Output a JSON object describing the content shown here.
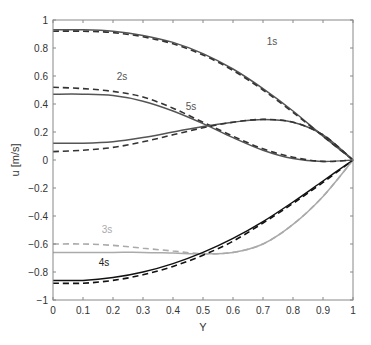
{
  "chart_data": {
    "type": "line",
    "title": "",
    "xlabel": "Y",
    "ylabel": "u [m/s]",
    "xlim": [
      0,
      1
    ],
    "ylim": [
      -1,
      1
    ],
    "grid": false,
    "x_ticks": [
      "0",
      "0.1",
      "0.2",
      "0.3",
      "0.4",
      "0.5",
      "0.6",
      "0.7",
      "0.8",
      "0.9",
      "1"
    ],
    "y_ticks": [
      "1",
      "0.8",
      "0.6",
      "0.4",
      "0.2",
      "0",
      "−0.2",
      "−0.4",
      "−0.6",
      "−0.8",
      "−1"
    ],
    "x": [
      0,
      0.1,
      0.2,
      0.3,
      0.4,
      0.5,
      0.6,
      0.7,
      0.8,
      0.9,
      1.0
    ],
    "annotations": [
      {
        "text": "1s",
        "x": 0.73,
        "y": 0.82,
        "color": "#555555"
      },
      {
        "text": "2s",
        "x": 0.23,
        "y": 0.57,
        "color": "#555555"
      },
      {
        "text": "5s",
        "x": 0.46,
        "y": 0.36,
        "color": "#555555"
      },
      {
        "text": "3s",
        "x": 0.18,
        "y": -0.52,
        "color": "#aaaaaa"
      },
      {
        "text": "4s",
        "x": 0.17,
        "y": -0.76,
        "color": "#222222"
      }
    ],
    "series": [
      {
        "name": "1s solid",
        "style": "solid",
        "color": "#555555",
        "values": [
          0.93,
          0.93,
          0.92,
          0.89,
          0.84,
          0.76,
          0.65,
          0.51,
          0.35,
          0.17,
          0.0
        ]
      },
      {
        "name": "1s dashed",
        "style": "dashed",
        "color": "#333333",
        "values": [
          0.92,
          0.92,
          0.91,
          0.88,
          0.83,
          0.75,
          0.64,
          0.5,
          0.34,
          0.17,
          0.0
        ]
      },
      {
        "name": "2s solid",
        "style": "solid",
        "color": "#555555",
        "values": [
          0.47,
          0.47,
          0.46,
          0.42,
          0.35,
          0.26,
          0.16,
          0.07,
          0.01,
          -0.01,
          0.0
        ]
      },
      {
        "name": "2s dashed",
        "style": "dashed",
        "color": "#333333",
        "values": [
          0.52,
          0.51,
          0.49,
          0.45,
          0.37,
          0.27,
          0.17,
          0.08,
          0.02,
          -0.01,
          0.0
        ]
      },
      {
        "name": "5s solid",
        "style": "solid",
        "color": "#555555",
        "values": [
          0.12,
          0.12,
          0.13,
          0.16,
          0.2,
          0.24,
          0.27,
          0.29,
          0.27,
          0.18,
          0.0
        ]
      },
      {
        "name": "5s dashed",
        "style": "dashed",
        "color": "#333333",
        "values": [
          0.06,
          0.07,
          0.09,
          0.13,
          0.18,
          0.23,
          0.27,
          0.29,
          0.27,
          0.18,
          0.0
        ]
      },
      {
        "name": "3s solid",
        "style": "solid",
        "color": "#aaaaaa",
        "values": [
          -0.66,
          -0.66,
          -0.66,
          -0.66,
          -0.665,
          -0.67,
          -0.66,
          -0.6,
          -0.46,
          -0.26,
          0.0
        ]
      },
      {
        "name": "3s dashed",
        "style": "dashed",
        "color": "#aaaaaa",
        "values": [
          -0.6,
          -0.6,
          -0.61,
          -0.63,
          -0.65,
          -0.67,
          -0.66,
          -0.6,
          -0.46,
          -0.26,
          0.0
        ]
      },
      {
        "name": "4s solid",
        "style": "solid",
        "color": "#111111",
        "values": [
          -0.86,
          -0.86,
          -0.84,
          -0.8,
          -0.74,
          -0.66,
          -0.56,
          -0.44,
          -0.3,
          -0.15,
          0.0
        ]
      },
      {
        "name": "4s dashed",
        "style": "dashed",
        "color": "#111111",
        "values": [
          -0.88,
          -0.88,
          -0.86,
          -0.82,
          -0.76,
          -0.68,
          -0.58,
          -0.45,
          -0.31,
          -0.16,
          0.0
        ]
      }
    ]
  }
}
